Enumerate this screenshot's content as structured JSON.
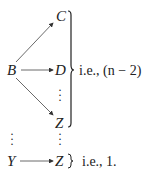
{
  "diagram": {
    "nodes": {
      "B": "B",
      "C": "C",
      "D": "D",
      "Z1": "Z",
      "Y": "Y",
      "Z2": "Z"
    },
    "edges": [
      {
        "from": "B",
        "to": "C"
      },
      {
        "from": "B",
        "to": "D"
      },
      {
        "from": "B",
        "to": "Z"
      },
      {
        "from": "Y",
        "to": "Z"
      }
    ],
    "labels": {
      "group_label": "i.e., (n − 2)",
      "single_label": "i.e., 1."
    },
    "ellipsis": "⋮"
  }
}
